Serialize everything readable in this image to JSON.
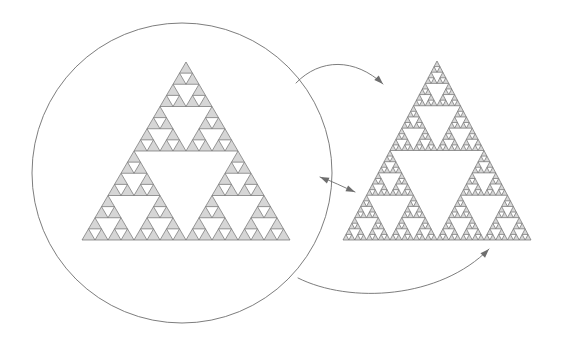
{
  "figure": {
    "canvas": {
      "width": 564,
      "height": 357,
      "background": "#ffffff"
    },
    "colors": {
      "triangle_fill": "#d6d6d6",
      "triangle_stroke": "#6e6e6e",
      "circle_stroke": "#6e6e6e",
      "arrow_stroke": "#6e6e6e",
      "background": "#ffffff"
    },
    "stroke_widths": {
      "triangle": 0.7,
      "circle": 0.9,
      "arrow": 0.9
    }
  },
  "lens_circle": {
    "label": "magnifying-lens-circle",
    "cx": 182,
    "cy": 173,
    "r": 150,
    "fill": "none"
  },
  "shapes": [
    {
      "id": "left-sierpinski",
      "label": "Sierpinski triangle (coarse, inside lens)",
      "depth": 4,
      "apex": {
        "x": 186,
        "y": 62
      },
      "base_left": {
        "x": 82,
        "y": 240
      },
      "base_right": {
        "x": 290,
        "y": 240
      },
      "side_length": 208
    },
    {
      "id": "right-sierpinski",
      "label": "Sierpinski triangle (fine, one level deeper)",
      "depth": 5,
      "apex": {
        "x": 437,
        "y": 61
      },
      "base_left": {
        "x": 343,
        "y": 240
      },
      "base_right": {
        "x": 531,
        "y": 240
      },
      "side_length": 188
    }
  ],
  "arrows": [
    {
      "id": "arrow-top",
      "label": "top mapping arrow (lens apex region to right figure apex region)",
      "path": "M 296,83 C 320,58 355,58 383,84",
      "head_at": {
        "x": 383,
        "y": 84
      },
      "head_angle_deg": 44,
      "double_headed": false
    },
    {
      "id": "arrow-middle",
      "label": "middle mapping arrow (lens right edge to right figure left edge)",
      "path": "M 320,177 C 332,181 343,187 355,192",
      "head_at": {
        "x": 355,
        "y": 192
      },
      "head_angle_deg": 24,
      "back_head_at": {
        "x": 320,
        "y": 177
      },
      "back_head_angle_deg": 204,
      "double_headed": true
    },
    {
      "id": "arrow-bottom",
      "label": "bottom mapping arrow (lens lower-right to right figure base)",
      "path": "M 298,278 C 350,304 440,299 489,249",
      "head_at": {
        "x": 489,
        "y": 249
      },
      "head_angle_deg": -46,
      "double_headed": false
    }
  ],
  "arrowhead": {
    "length": 9,
    "half_width": 3.2
  }
}
